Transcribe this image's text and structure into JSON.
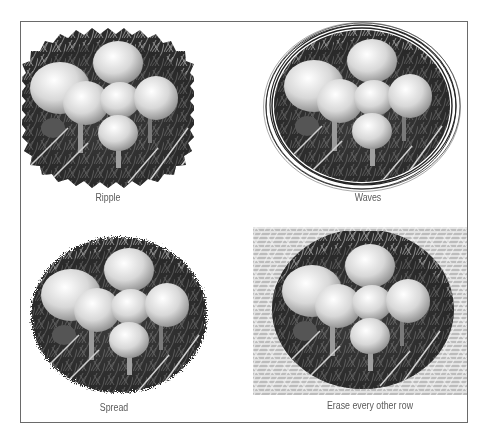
{
  "figure": {
    "panels": [
      {
        "id": "ripple",
        "caption": "Ripple",
        "effect": "ripple-edge"
      },
      {
        "id": "waves",
        "caption": "Waves",
        "effect": "wave-rings-edge"
      },
      {
        "id": "spread",
        "caption": "Spread",
        "effect": "spread-edge"
      },
      {
        "id": "erase-rows",
        "caption": "Erase every other row",
        "effect": "striped-background"
      }
    ],
    "colors": {
      "frame_border": "#6a6a6a",
      "caption_text": "#5a5a5a",
      "background": "#ffffff"
    }
  }
}
